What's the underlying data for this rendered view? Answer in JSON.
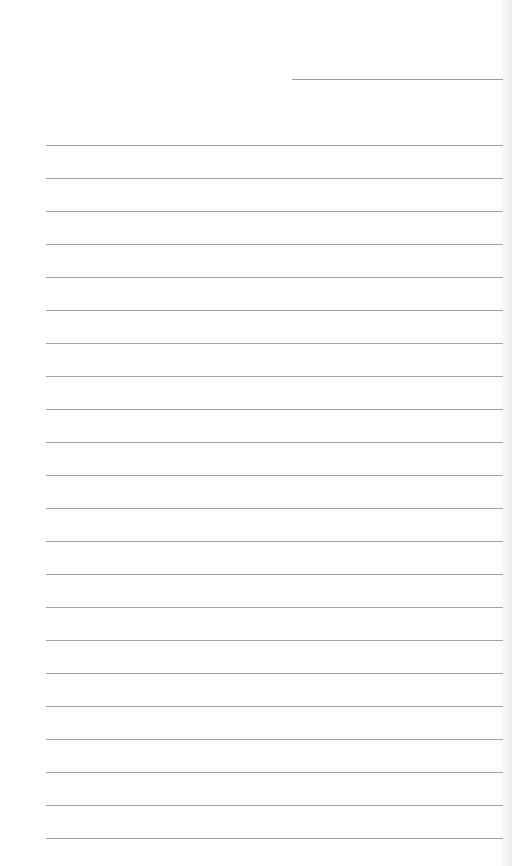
{
  "document": {
    "type": "blank lined writing sheet",
    "header_line": {
      "present": true
    },
    "ruled_lines": {
      "count": 22,
      "first_y": 145,
      "spacing": 33,
      "color": "#a3a3a3"
    }
  }
}
